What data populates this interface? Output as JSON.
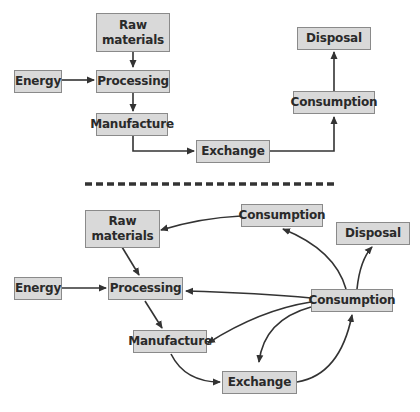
{
  "diagram": {
    "top": {
      "title": "Linear model",
      "nodes": {
        "raw_materials": "Raw\nmaterials",
        "energy": "Energy",
        "processing": "Processing",
        "manufacture": "Manufacture",
        "exchange": "Exchange",
        "consumption": "Consumption",
        "disposal": "Disposal"
      },
      "edges": [
        [
          "Raw materials",
          "Processing"
        ],
        [
          "Energy",
          "Processing"
        ],
        [
          "Processing",
          "Manufacture"
        ],
        [
          "Manufacture",
          "Exchange"
        ],
        [
          "Exchange",
          "Consumption"
        ],
        [
          "Consumption",
          "Disposal"
        ]
      ]
    },
    "divider": "dashed",
    "bottom": {
      "title": "Circular model",
      "nodes": {
        "raw_materials": "Raw\nmaterials",
        "energy": "Energy",
        "processing": "Processing",
        "manufacture": "Manufacture",
        "exchange": "Exchange",
        "consumption_top": "Consumption",
        "consumption_main": "Consumption",
        "disposal": "Disposal"
      },
      "edges": [
        [
          "Consumption (top)",
          "Raw materials"
        ],
        [
          "Raw materials",
          "Processing"
        ],
        [
          "Energy",
          "Processing"
        ],
        [
          "Processing",
          "Manufacture"
        ],
        [
          "Manufacture",
          "Exchange"
        ],
        [
          "Exchange",
          "Consumption"
        ],
        [
          "Consumption",
          "Consumption (top)"
        ],
        [
          "Consumption",
          "Disposal"
        ],
        [
          "Consumption",
          "Processing"
        ],
        [
          "Consumption",
          "Manufacture"
        ],
        [
          "Consumption",
          "Exchange"
        ]
      ]
    },
    "colors": {
      "box_fill": "#d9d9d9",
      "box_border": "#8a8a8a",
      "line": "#333333"
    }
  }
}
